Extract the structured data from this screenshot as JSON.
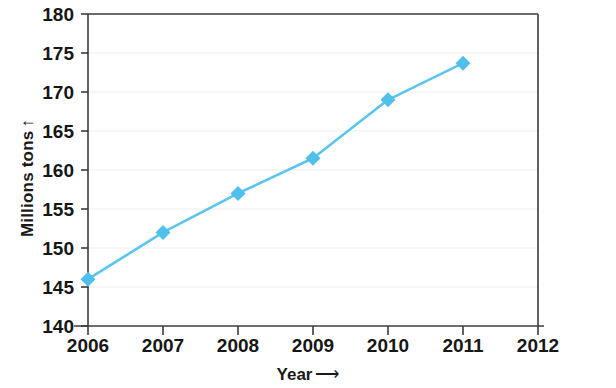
{
  "chart_data": {
    "type": "line",
    "title": "",
    "xlabel": "Year",
    "xlabel_arrow": "⟶",
    "ylabel": "Millions tons",
    "ylabel_arrow": "↑",
    "x": [
      2006,
      2007,
      2008,
      2009,
      2010,
      2011
    ],
    "values": [
      146,
      152,
      157,
      161.5,
      169,
      173.7
    ],
    "series": [
      {
        "name": "Millions tons",
        "values": [
          146,
          152,
          157,
          161.5,
          169,
          173.7
        ]
      }
    ],
    "xticks": [
      "2006",
      "2007",
      "2008",
      "2009",
      "2010",
      "2011",
      "2012"
    ],
    "xtick_values": [
      2006,
      2007,
      2008,
      2009,
      2010,
      2011,
      2012
    ],
    "yticks": [
      "140",
      "145",
      "150",
      "155",
      "160",
      "165",
      "170",
      "175",
      "180"
    ],
    "ytick_values": [
      140,
      145,
      150,
      155,
      160,
      165,
      170,
      175,
      180
    ],
    "xlim": [
      2006,
      2012
    ],
    "ylim": [
      140,
      180
    ],
    "grid": true,
    "grid_axis": "y",
    "legend": false,
    "marker": "diamond",
    "line_color": "#5BC5EE",
    "marker_color": "#4FC0EA",
    "grid_color": "#EDEDED",
    "axis_color": "#3C3C3C",
    "background_color": "#FFFFFF"
  }
}
